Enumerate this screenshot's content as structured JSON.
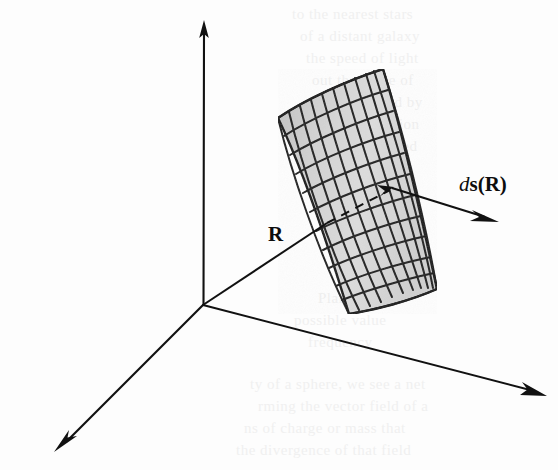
{
  "figure": {
    "kind": "vector-calculus-diagram",
    "canvas": {
      "width": 558,
      "height": 470
    },
    "background_color": "#fdfdfd",
    "ink_color": "#0d0d0d"
  },
  "labels": {
    "position_vector": "R",
    "surface_element_d": "d",
    "surface_element_s": "s",
    "surface_element_open": "(",
    "surface_element_R": "R",
    "surface_element_close": ")",
    "surface_element_full": "ds(R)"
  },
  "axes": {
    "origin": {
      "x": 203,
      "y": 305
    },
    "items": [
      {
        "name": "vertical-axis",
        "tip": {
          "x": 204,
          "y": 22
        },
        "direction": "up"
      },
      {
        "name": "left-axis",
        "tip": {
          "x": 54,
          "y": 450
        },
        "direction": "down-left"
      },
      {
        "name": "right-axis",
        "tip": {
          "x": 545,
          "y": 395
        },
        "direction": "right-down"
      }
    ],
    "arrowheads": 3,
    "line_color": "#111111",
    "line_width": 2
  },
  "position_vector": {
    "name": "R",
    "from": {
      "x": 203,
      "y": 305
    },
    "to": {
      "x": 325,
      "y": 224
    },
    "dashed_continuation_to": {
      "x": 390,
      "y": 190
    },
    "has_arrowhead_at_surface_point": true
  },
  "surface_element_vector": {
    "name": "ds(R)",
    "from": {
      "x": 392,
      "y": 189
    },
    "to": {
      "x": 497,
      "y": 222
    },
    "has_arrowhead": true
  },
  "surface_patch": {
    "fill_color": "#d6d6d6",
    "fill_color_shadow": "#bdbdbd",
    "grid_line_color": "#1a1a1a",
    "grid_columns": 10,
    "grid_rows": 11,
    "corners": {
      "top_left": {
        "x": 278,
        "y": 118
      },
      "top_right": {
        "x": 383,
        "y": 69
      },
      "bottom_right": {
        "x": 437,
        "y": 289
      },
      "bottom_left": {
        "x": 349,
        "y": 314
      }
    },
    "curvature": "bilinear-curved-patch-bulging-left"
  },
  "ghost_text": {
    "note": "faint bleed-through text from reverse page",
    "color": "#f0f0f0",
    "lines": [
      {
        "text": "to the nearest stars",
        "x": 292,
        "y": 6
      },
      {
        "text": "of a distant galaxy",
        "x": 300,
        "y": 28
      },
      {
        "text": "the speed of light",
        "x": 306,
        "y": 50
      },
      {
        "text": "out the value of",
        "x": 312,
        "y": 72
      },
      {
        "text": "determined by",
        "x": 330,
        "y": 94
      },
      {
        "text": "of radiation",
        "x": 344,
        "y": 116
      },
      {
        "text": "measured",
        "x": 356,
        "y": 138
      },
      {
        "text": "and the",
        "x": 366,
        "y": 160
      },
      {
        "text": "Planck",
        "x": 318,
        "y": 290
      },
      {
        "text": "possible value",
        "x": 294,
        "y": 312
      },
      {
        "text": "frequency",
        "x": 308,
        "y": 334
      },
      {
        "text": "ty of a sphere, we see a net",
        "x": 250,
        "y": 376
      },
      {
        "text": "rming the vector field of a",
        "x": 258,
        "y": 398
      },
      {
        "text": "ns of charge or mass that",
        "x": 244,
        "y": 420
      },
      {
        "text": "the divergence of that field",
        "x": 236,
        "y": 442
      }
    ]
  }
}
